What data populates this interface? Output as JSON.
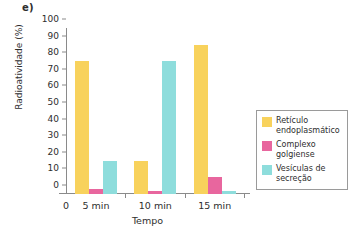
{
  "panel": {
    "label": "e)"
  },
  "chart_data": {
    "type": "bar",
    "title": "",
    "xlabel": "Tempo",
    "ylabel": "Radioatividade (%)",
    "categories": [
      "5 min",
      "10 min",
      "15 min"
    ],
    "origin_tick": "0",
    "ylim": [
      0,
      100
    ],
    "ytick_step": 10,
    "yticks": [
      0,
      10,
      20,
      30,
      40,
      50,
      60,
      70,
      80,
      90,
      100
    ],
    "grid": false,
    "legend_position": "right",
    "series": [
      {
        "name": "Retículo endoplasmático",
        "color": "#F8D25C",
        "values": [
          80,
          20,
          90
        ]
      },
      {
        "name": "Complexo golgiense",
        "color": "#E8669E",
        "values": [
          3,
          2,
          10
        ]
      },
      {
        "name": "Vesículas de secreção",
        "color": "#8EDDDC",
        "values": [
          20,
          80,
          2
        ]
      }
    ]
  }
}
